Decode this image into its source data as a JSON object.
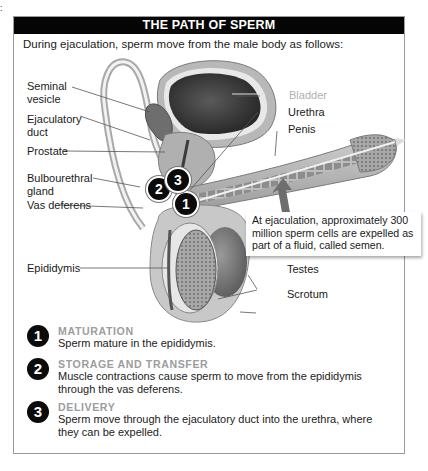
{
  "corner_mark": ":",
  "header": {
    "title": "THE PATH OF SPERM"
  },
  "intro": "During ejaculation, sperm move from the male body as follows:",
  "labels": {
    "seminal_vesicle": "Seminal\nvesicle",
    "ejaculatory_duct": "Ejaculatory\nduct",
    "prostate": "Prostate",
    "bulbourethral_gland": "Bulbourethral\ngland",
    "vas_deferens": "Vas deferens",
    "epididymis": "Epididymis",
    "bladder": "Bladder",
    "urethra": "Urethra",
    "penis": "Penis",
    "testes": "Testes",
    "scrotum": "Scrotum"
  },
  "callout": "At ejaculation, approximately 300 million sperm cells are expelled as part of a fluid, called semen.",
  "badges": [
    "1",
    "2",
    "3"
  ],
  "steps": [
    {
      "num": "1",
      "title": "MATURATION",
      "desc": "Sperm mature in the epididymis."
    },
    {
      "num": "2",
      "title": "STORAGE AND TRANSFER",
      "desc": "Muscle contractions cause sperm to move from the epididymis through the vas deferens."
    },
    {
      "num": "3",
      "title": "DELIVERY",
      "desc": "Sperm move through the ejaculatory duct into the urethra, where they can be expelled."
    }
  ],
  "colors": {
    "header_bg": "#050505",
    "step_title": "#9d9d9d",
    "frame_border": "#9a9a9a",
    "bladder_label": "#b0b0b0"
  }
}
